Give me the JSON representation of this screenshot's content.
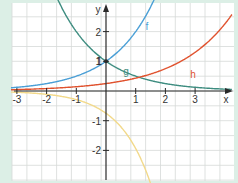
{
  "chart_data": {
    "type": "line",
    "title": "",
    "xlabel": "x",
    "ylabel": "y",
    "xlim": [
      -3.2,
      4.2
    ],
    "ylim": [
      -2.95,
      3.0
    ],
    "grid": true,
    "grid_step": 0.5,
    "x_ticks": [
      -3,
      -2,
      -1,
      1,
      2,
      3
    ],
    "y_ticks": [
      2,
      1,
      -1,
      -2
    ],
    "x_tick_labels": [
      "-3",
      "-2",
      "-1",
      "1",
      "2",
      "3"
    ],
    "y_tick_labels": [
      "2",
      "1",
      "-1",
      "-2"
    ],
    "series": [
      {
        "name": "f",
        "label": "f",
        "color": "#4a9fd6",
        "formula": "2^x",
        "x": [
          -3,
          -2,
          -1,
          0,
          1,
          1.5
        ],
        "values": [
          0.125,
          0.25,
          0.5,
          1,
          2,
          2.83
        ]
      },
      {
        "name": "g",
        "label": "g",
        "color": "#3e8d80",
        "formula": "2^-x",
        "x": [
          -1.5,
          -1,
          0,
          1,
          2,
          3,
          4
        ],
        "values": [
          2.83,
          2,
          1,
          0.5,
          0.25,
          0.125,
          0.06
        ]
      },
      {
        "name": "h",
        "label": "h",
        "color": "#e0522e",
        "x": [
          -3,
          -2,
          -1,
          0,
          1,
          2,
          3,
          4
        ],
        "values": [
          0.05,
          0.08,
          0.14,
          0.25,
          0.43,
          0.75,
          1.3,
          2.26
        ]
      },
      {
        "name": "unlabeled",
        "label": "",
        "color": "#f2d98a",
        "x": [
          -3,
          -2,
          -1,
          0,
          0.5,
          1,
          1.1
        ],
        "values": [
          -0.04,
          -0.11,
          -0.29,
          -0.75,
          -1.2,
          -1.94,
          -2.1
        ]
      }
    ],
    "annotations": [
      {
        "text": "f",
        "x": 1.45,
        "y": 2.6
      },
      {
        "text": "g",
        "x": 0.55,
        "y": 0.85
      },
      {
        "text": "h",
        "x": 2.3,
        "y": 0.75
      },
      {
        "text": "1",
        "x": -0.15,
        "y": 1
      }
    ],
    "points": [
      {
        "x": 0,
        "y": 1
      }
    ]
  }
}
